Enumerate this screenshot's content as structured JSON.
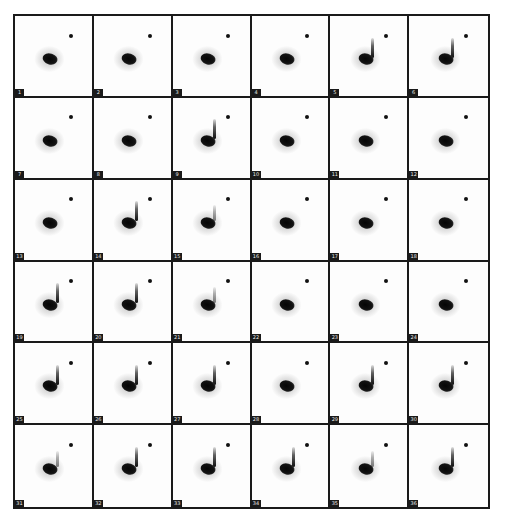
{
  "figure": {
    "rows": 6,
    "cols": 6,
    "border_color": "#1a1a1a",
    "background_color": "#ffffff",
    "blob_color": "#0a0a0a",
    "panels": [
      {
        "label": "1",
        "streak": "none"
      },
      {
        "label": "2",
        "streak": "none"
      },
      {
        "label": "3",
        "streak": "none"
      },
      {
        "label": "4",
        "streak": "none"
      },
      {
        "label": "5",
        "streak": "strong"
      },
      {
        "label": "6",
        "streak": "strong"
      },
      {
        "label": "7",
        "streak": "none"
      },
      {
        "label": "8",
        "streak": "none"
      },
      {
        "label": "9",
        "streak": "strong"
      },
      {
        "label": "10",
        "streak": "none"
      },
      {
        "label": "11",
        "streak": "none"
      },
      {
        "label": "12",
        "streak": "none"
      },
      {
        "label": "13",
        "streak": "none"
      },
      {
        "label": "14",
        "streak": "strong"
      },
      {
        "label": "15",
        "streak": "faint"
      },
      {
        "label": "16",
        "streak": "none"
      },
      {
        "label": "17",
        "streak": "none"
      },
      {
        "label": "18",
        "streak": "none"
      },
      {
        "label": "19",
        "streak": "strong"
      },
      {
        "label": "20",
        "streak": "strong"
      },
      {
        "label": "21",
        "streak": "faint"
      },
      {
        "label": "22",
        "streak": "none"
      },
      {
        "label": "23",
        "streak": "none"
      },
      {
        "label": "24",
        "streak": "none"
      },
      {
        "label": "25",
        "streak": "strong"
      },
      {
        "label": "26",
        "streak": "strong"
      },
      {
        "label": "27",
        "streak": "strong"
      },
      {
        "label": "28",
        "streak": "none"
      },
      {
        "label": "29",
        "streak": "strong"
      },
      {
        "label": "30",
        "streak": "strong"
      },
      {
        "label": "31",
        "streak": "faint"
      },
      {
        "label": "32",
        "streak": "strong"
      },
      {
        "label": "33",
        "streak": "strong"
      },
      {
        "label": "34",
        "streak": "strong"
      },
      {
        "label": "35",
        "streak": "faint"
      },
      {
        "label": "36",
        "streak": "strong"
      }
    ]
  }
}
